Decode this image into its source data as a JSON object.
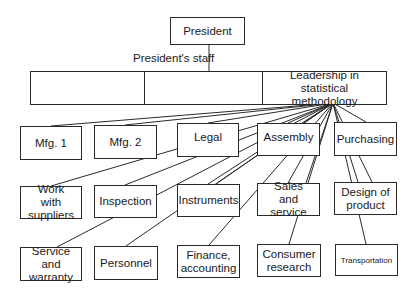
{
  "chart": {
    "top": {
      "label": "President"
    },
    "staff": {
      "label": "President's staff",
      "cells": [
        {
          "label": ""
        },
        {
          "label": ""
        },
        {
          "label": "Leadership in statistical methodology"
        }
      ]
    },
    "departments": [
      {
        "label": "Mfg. 1"
      },
      {
        "label": "Mfg. 2"
      },
      {
        "label": "Legal"
      },
      {
        "label": "Assembly"
      },
      {
        "label": "Purchasing"
      },
      {
        "label": "Work with suppliers"
      },
      {
        "label": "Inspection"
      },
      {
        "label": "Instruments"
      },
      {
        "label": "Sales and service"
      },
      {
        "label": "Design of product"
      },
      {
        "label": "Service and warranty"
      },
      {
        "label": "Personnel"
      },
      {
        "label": "Finance, accounting"
      },
      {
        "label": "Consumer research"
      },
      {
        "label": "Transportation"
      }
    ],
    "colors": {
      "line": "#2a2a2a",
      "box_fill": "#ffffff"
    }
  }
}
